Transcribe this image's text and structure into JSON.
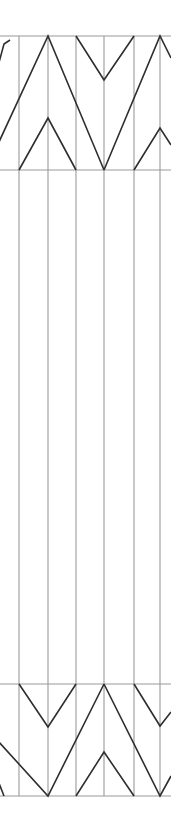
{
  "canvas": {
    "width": 171,
    "height": 835,
    "background": "#ffffff",
    "title": "zigzag-chevron-panel-diagram"
  },
  "style": {
    "grid_line_color": "#9a9a9a",
    "grid_line_width": 1.1,
    "zigzag_line_color": "#2e2e2e",
    "zigzag_line_width": 1.6,
    "fill": "none"
  },
  "geometry": {
    "panel_left": 19,
    "panel_right": 160,
    "top_band_top": 36,
    "top_band_bottom": 170,
    "middle_band_top": 170,
    "middle_band_bottom": 684,
    "bottom_band_top": 684,
    "bottom_band_bottom": 796,
    "column_x": [
      19,
      48,
      76,
      104,
      134,
      160
    ],
    "column_count": 6
  },
  "horizontal_rules": [
    {
      "name": "top-rule",
      "y": 36,
      "x1": 0,
      "x2": 171
    },
    {
      "name": "upper-mid-rule",
      "y": 170,
      "x1": 0,
      "x2": 171
    },
    {
      "name": "lower-mid-rule",
      "y": 684,
      "x1": 0,
      "x2": 171
    },
    {
      "name": "bottom-rule",
      "y": 796,
      "x1": 0,
      "x2": 171
    }
  ],
  "vertical_rules": [
    {
      "name": "column-line-1",
      "x": 19,
      "y1": 36,
      "y2": 796
    },
    {
      "name": "column-line-2",
      "x": 48,
      "y1": 36,
      "y2": 796
    },
    {
      "name": "column-line-3",
      "x": 76,
      "y1": 36,
      "y2": 796
    },
    {
      "name": "column-line-4",
      "x": 104,
      "y1": 36,
      "y2": 796
    },
    {
      "name": "column-line-5",
      "x": 134,
      "y1": 36,
      "y2": 796
    },
    {
      "name": "column-line-6",
      "x": 160,
      "y1": 36,
      "y2": 796
    }
  ],
  "zigzag_top": {
    "name": "top-chevron-band",
    "description": "Large chevrons spanning from top rule down to upper middle rule",
    "polylines": [
      {
        "name": "top-large-chevron-1",
        "points": "-14,110 4,44 10,40"
      },
      {
        "name": "top-large-chevron-2",
        "points": "-14,170 48,36 104,170"
      },
      {
        "name": "top-large-chevron-3",
        "points": "104,170 160,36 171,58"
      },
      {
        "name": "top-small-chevron-left",
        "points": "-10,170 -2,150"
      },
      {
        "name": "top-small-chevron-mid",
        "points": "19,170 48,118 76,170"
      },
      {
        "name": "top-small-chevron-right",
        "points": "76,36 104,80 134,36"
      },
      {
        "name": "top-small-chevron-far-right",
        "points": "134,170 160,128 171,145"
      }
    ]
  },
  "zigzag_bottom": {
    "name": "bottom-chevron-band",
    "description": "Large chevrons spanning from lower middle rule down to bottom rule",
    "polylines": [
      {
        "name": "bottom-large-chevron-1",
        "points": "-14,706 -2,700"
      },
      {
        "name": "bottom-large-chevron-2",
        "points": "-12,730 48,796 104,684"
      },
      {
        "name": "bottom-large-chevron-3",
        "points": "104,684 160,796 171,776"
      },
      {
        "name": "bottom-small-chevron-mid",
        "points": "19,684 48,727 76,684"
      },
      {
        "name": "bottom-small-chevron-right",
        "points": "76,796 104,752 134,796"
      },
      {
        "name": "bottom-small-chevron-far-right",
        "points": "134,684 160,726 171,712"
      },
      {
        "name": "bottom-small-chevron-far-left",
        "points": "-10,760 4,796"
      }
    ]
  }
}
